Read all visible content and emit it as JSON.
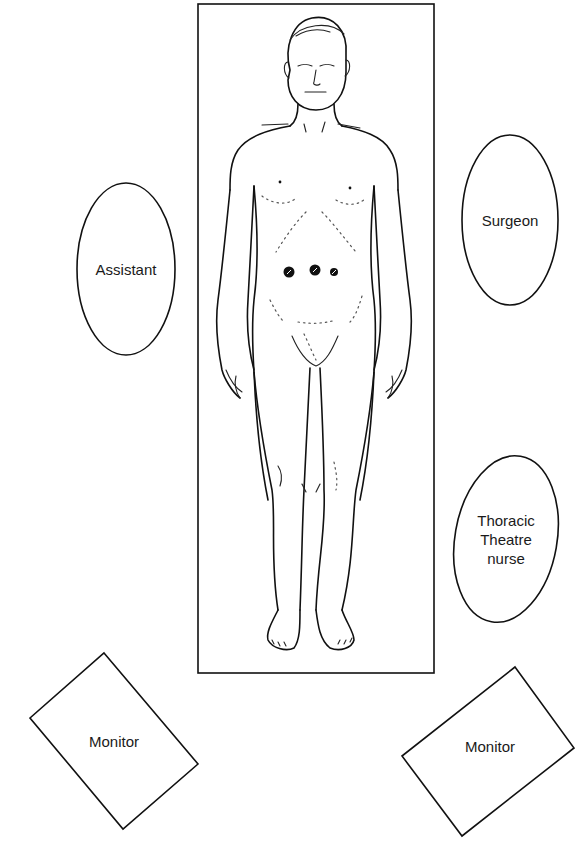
{
  "diagram": {
    "title": "",
    "colors": {
      "stroke": "#111111",
      "background": "#ffffff",
      "port": "#111111"
    },
    "table": {
      "name": "operating-table",
      "x": 198,
      "y": 4,
      "width": 236,
      "height": 669
    },
    "personnel": [
      {
        "id": "assistant",
        "label": "Assistant",
        "cx": 126,
        "cy": 269,
        "rx": 49,
        "ry": 86,
        "rotate": 0
      },
      {
        "id": "surgeon",
        "label": "Surgeon",
        "cx": 510,
        "cy": 220,
        "rx": 48,
        "ry": 85,
        "rotate": 0
      },
      {
        "id": "thoracic-theatre-nurse",
        "label": "Thoracic\nTheatre\nnurse",
        "cx": 506,
        "cy": 539,
        "rx": 51,
        "ry": 84,
        "rotate": 10
      }
    ],
    "monitors": [
      {
        "id": "monitor-left",
        "label": "Monitor",
        "points": "104,653 198,764 123,829 30,718",
        "cx": 114,
        "cy": 741
      },
      {
        "id": "monitor-right",
        "label": "Monitor",
        "points": "515,667 574,748 462,836 402,756",
        "cx": 490,
        "cy": 746
      }
    ],
    "ports": [
      {
        "id": "port-1",
        "cx": 289,
        "cy": 272,
        "r": 5.5
      },
      {
        "id": "port-2",
        "cx": 315,
        "cy": 270,
        "r": 5.5
      },
      {
        "id": "port-3",
        "cx": 334,
        "cy": 272,
        "r": 4
      }
    ],
    "patient": {
      "label": "",
      "position": "supine"
    }
  }
}
